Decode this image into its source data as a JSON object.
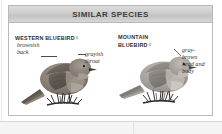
{
  "panel": {
    "title": "SIMILAR SPECIES",
    "species": [
      {
        "name": "WESTERN BLUEBIRD",
        "sex_symbol": "♀",
        "annotations": [
          {
            "text": "brownish\nback"
          },
          {
            "text": "grayish\nthroat"
          }
        ]
      },
      {
        "name": "MOUNTAIN\nBLUEBIRD",
        "sex_symbol": "♀",
        "annotations": [
          {
            "text": "gray-\nbrown\nhead and\nbody"
          }
        ]
      }
    ]
  },
  "colors": {
    "header_top": "#dcdcdc",
    "header_bottom": "#c4c4c4",
    "panel_border": "#b9b9bd",
    "title_text": "#3d3d3f",
    "caption_text": "#2e2e30",
    "annotation_text": "#333335",
    "bird_left_body": "#8a8078",
    "bird_left_back": "#6f675f",
    "bird_right_body": "#a7a39c",
    "bird_right_back": "#8d8a84",
    "perch": "#2f2b27",
    "page_band": "#f4f4f4"
  }
}
